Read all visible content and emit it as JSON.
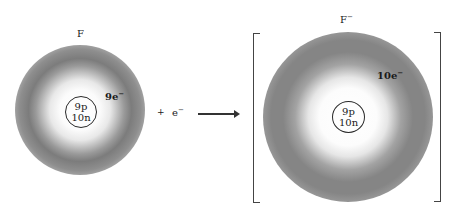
{
  "reactant": {
    "symbol": "F",
    "charge": "",
    "nucleus": {
      "protons": "9p",
      "neutrons": "10n"
    },
    "electrons": "9e",
    "electrons_sup": "−"
  },
  "plus_sign": "+",
  "added_electron": {
    "symbol": "e",
    "sup": "−"
  },
  "product": {
    "symbol": "F",
    "charge": "−",
    "nucleus": {
      "protons": "9p",
      "neutrons": "10n"
    },
    "electrons": "10e",
    "electrons_sup": "−"
  },
  "colors": {
    "cloud_dark": "#7c7c7c",
    "ink": "#1a1a1a",
    "background": "#ffffff"
  }
}
